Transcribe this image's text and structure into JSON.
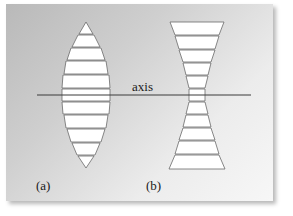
{
  "diagram": {
    "axis_label": "axis",
    "panel_a_label": "(a)",
    "panel_b_label": "(b)",
    "panel_a_description": "converging lens approximated by stacked prisms",
    "panel_b_description": "diverging lens approximated by stacked prisms",
    "colors": {
      "background_dark": "#b9b9b9",
      "background_light": "#f7f7f7",
      "prism_fill": "#ffffff",
      "stroke": "#555555",
      "axis_line": "#333333"
    }
  }
}
